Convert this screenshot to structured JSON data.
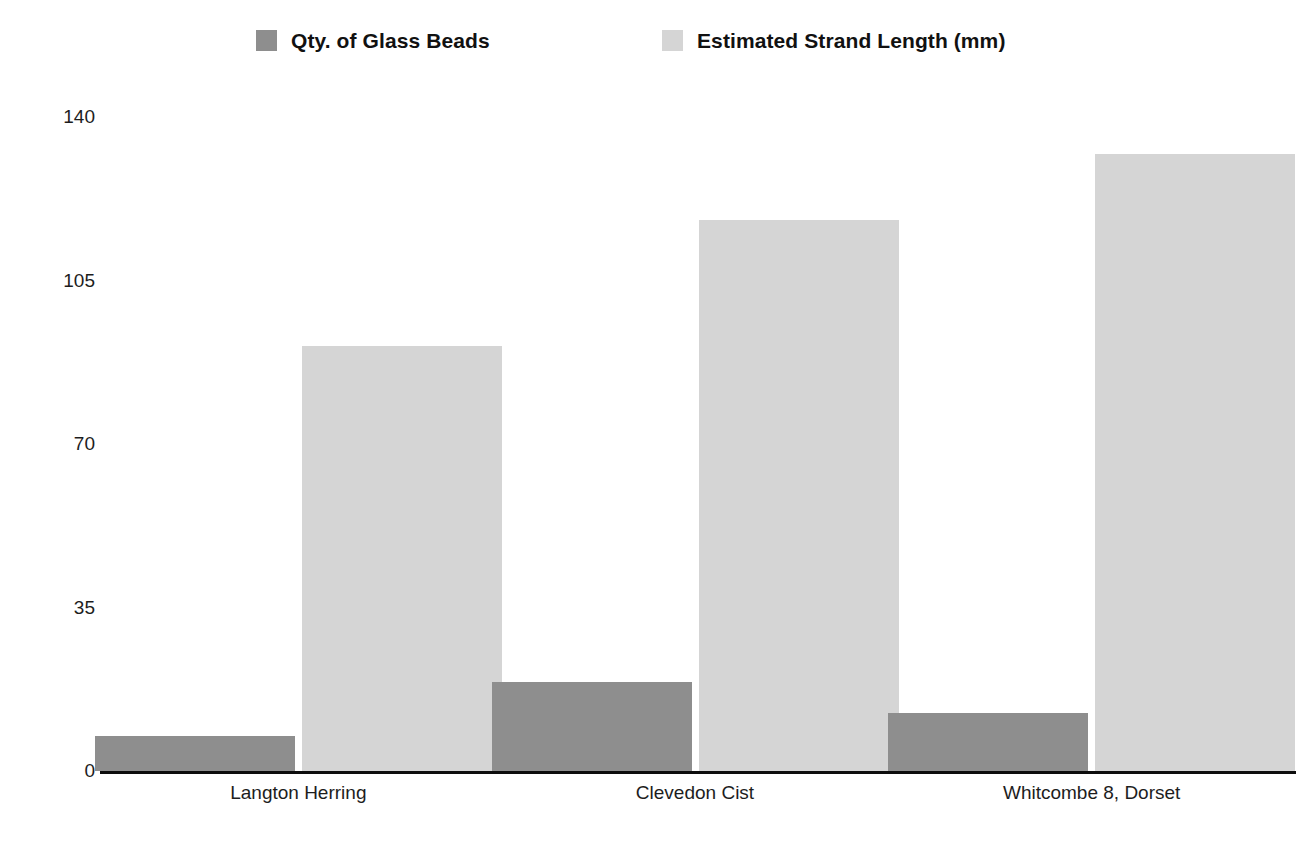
{
  "chart_data": {
    "type": "bar",
    "title": "",
    "subtitle": "",
    "xlabel": "",
    "ylabel": "",
    "grid": false,
    "legend_position": "top",
    "ylim": [
      0,
      140
    ],
    "yticks": [
      "0",
      "35",
      "70",
      "105",
      "140"
    ],
    "ytick_values": [
      0,
      35,
      70,
      105,
      140
    ],
    "categories": [
      "Langton Herring",
      "Clevedon Cist",
      "Whitcombe 8, Dorset"
    ],
    "series": [
      {
        "name": "Qty. of Glass Beads",
        "color": "#8e8e8e",
        "values": [
          7.5,
          19,
          12.5
        ]
      },
      {
        "name": "Estimated Strand Length (mm)",
        "color": "#d5d5d5",
        "values": [
          91,
          118,
          132
        ]
      }
    ]
  },
  "legend": {
    "entries": [
      {
        "label": "Qty. of Glass Beads",
        "color": "#8e8e8e"
      },
      {
        "label": "Estimated Strand Length (mm)",
        "color": "#d5d5d5"
      }
    ]
  },
  "axis": {
    "baseline_color": "#0d0d0d"
  }
}
